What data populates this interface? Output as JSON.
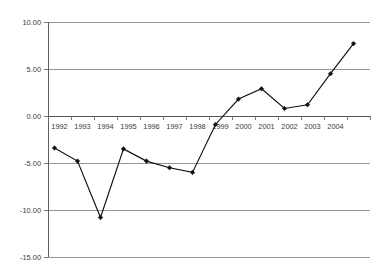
{
  "chart_data": {
    "type": "line",
    "title": "",
    "subtitle": "",
    "xlabel": "",
    "ylabel": "",
    "categories": [
      "1992",
      "1993",
      "1994",
      "1995",
      "1996",
      "1997",
      "1998",
      "1999",
      "2000",
      "2001",
      "2002",
      "2003",
      "2004",
      ""
    ],
    "x_tick_labels": [
      "1992",
      "1993",
      "1994",
      "1995",
      "1996",
      "1997",
      "1998",
      "1999",
      "2000",
      "2001",
      "2002",
      "2003",
      "2004"
    ],
    "series": [
      {
        "name": "",
        "values": [
          -3.4,
          -4.8,
          -10.8,
          -3.5,
          -4.8,
          -5.5,
          -6.0,
          -0.9,
          1.8,
          2.9,
          0.8,
          1.2,
          4.5,
          7.7
        ]
      }
    ],
    "y_tick_labels": [
      "10.00",
      "5.00",
      "0.00",
      "-5.00",
      "-10.00",
      "-15.00"
    ],
    "y_tick_values": [
      10,
      5,
      0,
      -5,
      -10,
      -15
    ],
    "ylim": [
      -15,
      10
    ],
    "grid": "horizontal",
    "legend": "none",
    "marker": "diamond",
    "line_color": "#111111",
    "marker_color": "#111111",
    "grid_color": "#8c8c8c",
    "axis_color": "#4d4d4d",
    "background_color": "#ffffff",
    "zero_line_value": 0
  }
}
